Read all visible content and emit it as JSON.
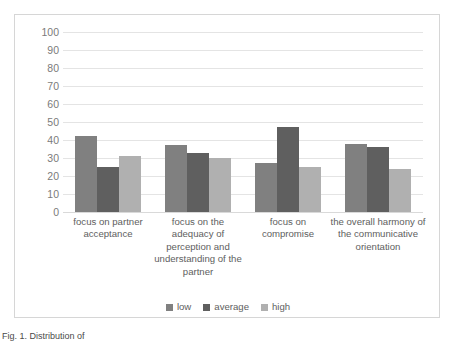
{
  "caption": "Fig. 1. Distribution of",
  "chart_data": {
    "type": "bar",
    "title": "",
    "xlabel": "",
    "ylabel": "",
    "ylim": [
      0,
      100
    ],
    "ytick_step": 10,
    "yticks": [
      "100",
      "90",
      "80",
      "70",
      "60",
      "50",
      "40",
      "30",
      "20",
      "10",
      "0"
    ],
    "grid": true,
    "legend_position": "bottom",
    "categories": [
      "focus on partner acceptance",
      "focus on the adequacy of perception and understanding of the partner",
      "focus on compromise",
      "the overall harmony of the communicative orientation"
    ],
    "series": [
      {
        "name": "low",
        "color": "#808080",
        "values": [
          42,
          37,
          27,
          38
        ]
      },
      {
        "name": "average",
        "color": "#5f5f5f",
        "values": [
          25,
          33,
          47,
          36
        ]
      },
      {
        "name": "high",
        "color": "#b0b0b0",
        "values": [
          31,
          30,
          25,
          24
        ]
      }
    ]
  }
}
